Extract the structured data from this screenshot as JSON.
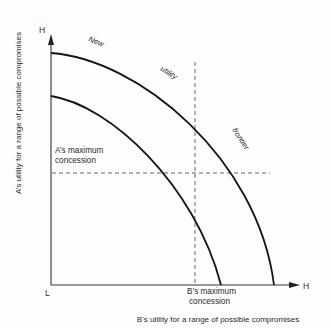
{
  "diagram": {
    "axes": {
      "y_top_label": "H",
      "x_right_label": "H",
      "origin_label": "L",
      "x_title": "B’s utility for a range of possible compromises",
      "y_title": "A’s utility for a range of possible compromises"
    },
    "curves": [
      {
        "name": "new-utility-frontier",
        "description": "outer curve"
      },
      {
        "name": "original-utility-frontier",
        "description": "inner curve"
      }
    ],
    "curve_labels": {
      "new": "New",
      "utility": "utility",
      "frontier": "frontier"
    },
    "annotations": {
      "a_max_line1": "A’s maximum",
      "a_max_line2": "concession",
      "b_max_line1": "B’s maximum",
      "b_max_line2": "concession"
    }
  },
  "colors": {
    "curve": "#151515",
    "axis": "#333333",
    "dashed": "#555555",
    "text": "#2a2a2a",
    "background": "#fdfdfd"
  }
}
